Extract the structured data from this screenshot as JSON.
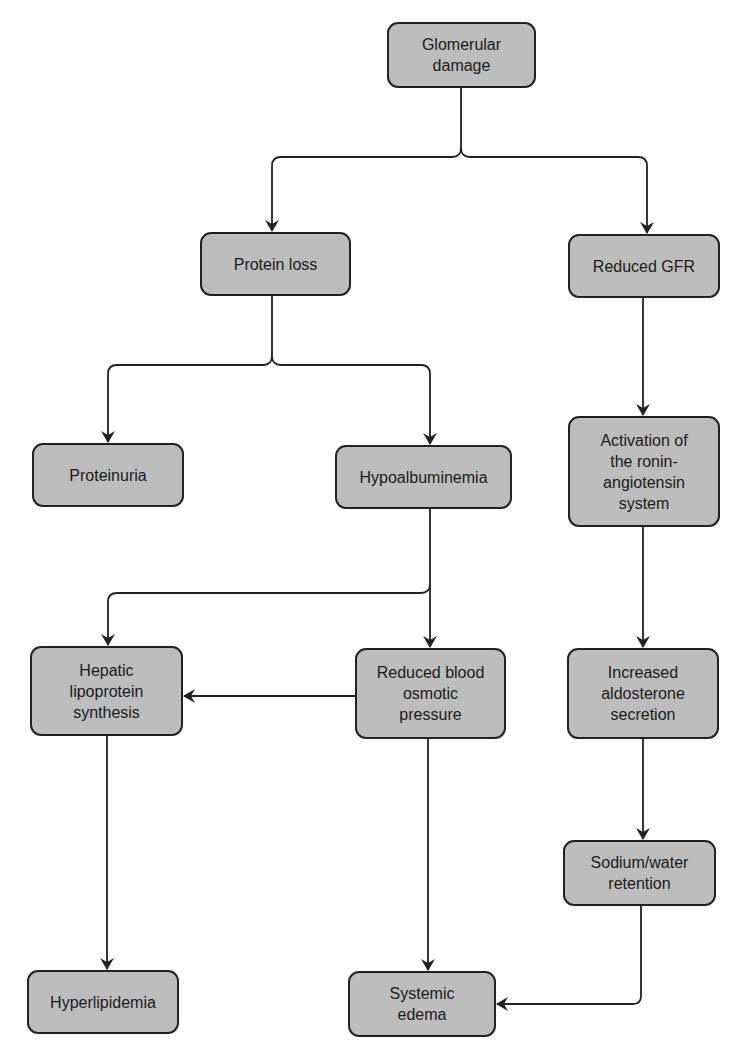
{
  "diagram": {
    "type": "flowchart",
    "colors": {
      "node_fill": "#bdbdbd",
      "node_border": "#222222",
      "edge": "#222222",
      "background": "#ffffff"
    },
    "nodes": {
      "glomerular_damage": {
        "label": "Glomerular\ndamage"
      },
      "protein_loss": {
        "label": "Protein loss"
      },
      "reduced_gfr": {
        "label": "Reduced GFR"
      },
      "proteinuria": {
        "label": "Proteinuria"
      },
      "hypoalbuminemia": {
        "label": "Hypoalbuminemia"
      },
      "raas_activation": {
        "label": "Activation of\nthe ronin-\nangiotensin\nsystem"
      },
      "hepatic_lipoprotein": {
        "label": "Hepatic\nlipoprotein\nsynthesis"
      },
      "reduced_osmotic": {
        "label": "Reduced blood\nosmotic\npressure"
      },
      "increased_aldosterone": {
        "label": "Increased\naldosterone\nsecretion"
      },
      "sodium_water": {
        "label": "Sodium/water\nretention"
      },
      "hyperlipidemia": {
        "label": "Hyperlipidemia"
      },
      "systemic_edema": {
        "label": "Systemic\nedema"
      }
    },
    "edges": [
      {
        "from": "glomerular_damage",
        "to": "protein_loss"
      },
      {
        "from": "glomerular_damage",
        "to": "reduced_gfr"
      },
      {
        "from": "protein_loss",
        "to": "proteinuria"
      },
      {
        "from": "protein_loss",
        "to": "hypoalbuminemia"
      },
      {
        "from": "reduced_gfr",
        "to": "raas_activation"
      },
      {
        "from": "hypoalbuminemia",
        "to": "hepatic_lipoprotein"
      },
      {
        "from": "hypoalbuminemia",
        "to": "reduced_osmotic"
      },
      {
        "from": "reduced_osmotic",
        "to": "hepatic_lipoprotein"
      },
      {
        "from": "raas_activation",
        "to": "increased_aldosterone"
      },
      {
        "from": "increased_aldosterone",
        "to": "sodium_water"
      },
      {
        "from": "hepatic_lipoprotein",
        "to": "hyperlipidemia"
      },
      {
        "from": "reduced_osmotic",
        "to": "systemic_edema"
      },
      {
        "from": "sodium_water",
        "to": "systemic_edema"
      }
    ]
  }
}
